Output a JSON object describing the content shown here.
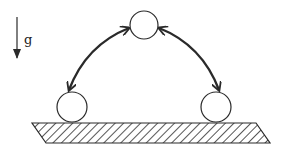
{
  "diagram": {
    "gravity_label": "g",
    "elements": {
      "gravity_arrow": {
        "direction": "down",
        "label": "g"
      },
      "balls": [
        {
          "name": "top",
          "position": "apex"
        },
        {
          "name": "left",
          "position": "rest-left"
        },
        {
          "name": "right",
          "position": "rest-right"
        }
      ],
      "arcs": [
        {
          "name": "left-arc",
          "from": "top",
          "to": "left",
          "arrowheads": "both"
        },
        {
          "name": "right-arc",
          "from": "top",
          "to": "right",
          "arrowheads": "both"
        }
      ],
      "ground": {
        "style": "hatched"
      }
    },
    "colors": {
      "stroke": "#2a2a2a",
      "background": "#ffffff"
    }
  }
}
